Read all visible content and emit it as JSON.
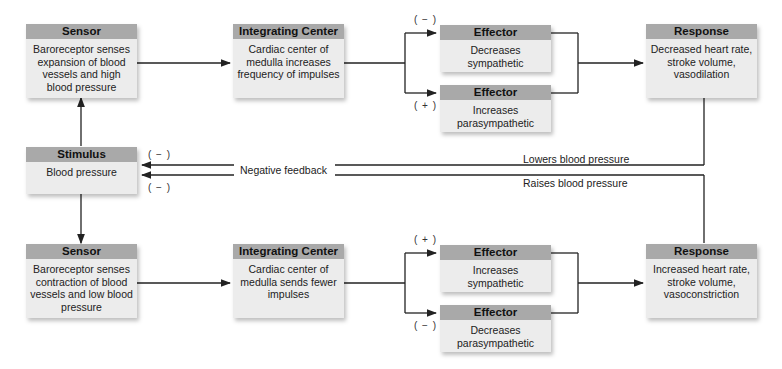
{
  "diagram": {
    "top_path": {
      "sensor": {
        "header": "Sensor",
        "body": "Baroreceptor senses expansion of blood vessels and high blood pressure"
      },
      "integrating_center": {
        "header": "Integrating Center",
        "body": "Cardiac center of medulla increases frequency of impulses"
      },
      "effector_1": {
        "header": "Effector",
        "body": "Decreases sympathetic",
        "sign": "( − )"
      },
      "effector_2": {
        "header": "Effector",
        "body": "Increases parasympathetic",
        "sign": "( + )"
      },
      "response": {
        "header": "Response",
        "body": "Decreased heart rate, stroke volume, vasodilation"
      },
      "feedback_label": "Lowers blood pressure"
    },
    "stimulus": {
      "header": "Stimulus",
      "body": "Blood pressure",
      "sign_top": "( − )",
      "sign_bottom": "( − )"
    },
    "feedback_center_label": "Negative feedback",
    "bottom_path": {
      "sensor": {
        "header": "Sensor",
        "body": "Baroreceptor senses contraction of blood vessels and low blood pressure"
      },
      "integrating_center": {
        "header": "Integrating Center",
        "body": "Cardiac center of medulla sends fewer impulses"
      },
      "effector_1": {
        "header": "Effector",
        "body": "Increases sympathetic",
        "sign": "( + )"
      },
      "effector_2": {
        "header": "Effector",
        "body": "Decreases parasympathetic",
        "sign": "( − )"
      },
      "response": {
        "header": "Response",
        "body": "Increased heart rate, stroke volume, vasoconstriction"
      },
      "feedback_label": "Raises blood pressure"
    },
    "colors": {
      "header_bg": "#a9a9a9",
      "box_bg": "#ececec",
      "line": "#222222"
    }
  }
}
